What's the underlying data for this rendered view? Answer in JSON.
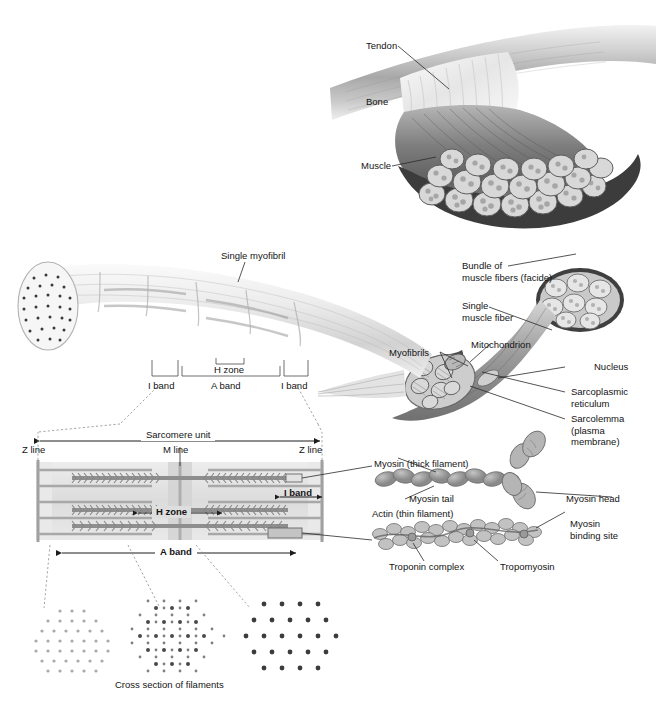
{
  "figure": {
    "caption": "Cross section of filaments"
  },
  "labels": {
    "tendon": "Tendon",
    "bone": "Bone",
    "muscle": "Muscle",
    "bundle_of_muscle_fibers": "Bundle of\nmuscle fibers (facide)",
    "single_muscle_fiber": "Single\nmuscle fiber",
    "mitochondrion": "Mitochondrion",
    "myofibrils": "Myofibrils",
    "nucleus": "Nucleus",
    "sarcoplasmic_reticulum": "Sarcoplasmic\nreticulum",
    "sarcolemma": "Sarcolemma\n(plasma\nmembrane)",
    "single_myofibril": "Single myofibril",
    "h_zone_top": "H zone",
    "i_band_left_top": "I band",
    "a_band_top": "A band",
    "i_band_right_top": "I band",
    "sarcomere_unit": "Sarcomere unit",
    "z_line_left": "Z line",
    "m_line": "M line",
    "z_line_right": "Z line",
    "i_band_sarcomere": "I band",
    "h_zone_sarcomere": "H zone",
    "a_band_sarcomere": "A band",
    "myosin_thick": "Myosin (thick filament)",
    "myosin_tail": "Myosin tail",
    "myosin_head": "Myosin head",
    "actin_thin": "Actin (thin filament)",
    "myosin_binding_site": "Myosin\nbinding site",
    "troponin_complex": "Troponin complex",
    "tropomyosin": "Tropomyosin",
    "cross_section_caption": "Cross section of filaments"
  },
  "colors": {
    "background": "#ffffff",
    "text": "#141414",
    "leader_line": "#2a2a2a",
    "dashed_line": "#8d8d8d",
    "bone_light": "#e8e8e8",
    "bone_mid": "#b4b4b4",
    "muscle_dark": "#6f6f6f",
    "muscle_mid": "#9a9a9a",
    "epimysium": "#3c3c3c",
    "fascicle_fill": "#d8d8d8",
    "myofibril_pale": "#e4e4e4",
    "filament_gray": "#9c9c9c",
    "sarcomere_band": "#dedede",
    "z_line": "#a0a0a0"
  },
  "cross_sections": [
    {
      "name": "i-band-cross-section",
      "pattern": "thin-filaments-only",
      "dot_count": 86,
      "dot_color": "#9a9a9a",
      "dot_size": 1.6
    },
    {
      "name": "overlap-cross-section",
      "pattern": "thick-and-thin-hexagonal",
      "dot_count": 120,
      "dot_color": "#4a4a4a",
      "dot_size": 2.0
    },
    {
      "name": "h-zone-cross-section",
      "pattern": "thick-filaments-only",
      "dot_count": 58,
      "dot_color": "#3c3c3c",
      "dot_size": 2.4
    }
  ]
}
